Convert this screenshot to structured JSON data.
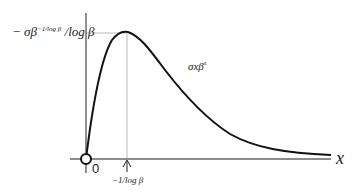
{
  "diagram": {
    "title": "",
    "labels": {
      "y_peak_label_prefix": "− σβ",
      "y_peak_label_exponent": "−1/log β",
      "y_peak_label_suffix": " /log β",
      "curve_label_base": "σxβ",
      "curve_label_exponent": "x",
      "origin_label": "0",
      "peak_x_label": "−1/log β",
      "x_axis_label": "x"
    },
    "elements": {
      "curve": "σxβ^x",
      "peak_point": {
        "x": "−1/log β",
        "y": "−σβ^(−1/log β)/log β"
      },
      "origin_marker": "open circle at 0",
      "peak_marker": "up arrow at −1/log β"
    },
    "colors": {
      "curve": "#111111",
      "axis": "#444444",
      "guide": "#bbbbbb"
    }
  }
}
